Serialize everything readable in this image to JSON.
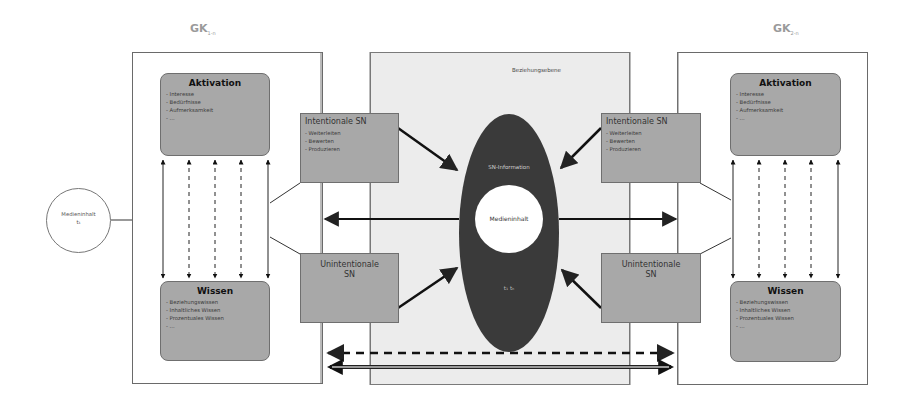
{
  "diagram": {
    "left_group": {
      "label": "GK",
      "label_sub": "1-n",
      "activation": {
        "title": "Aktivation",
        "items": [
          "- Interesse",
          "- Bedürfnisse",
          "- Aufmerksamkeit",
          "- ..."
        ]
      },
      "knowledge": {
        "title": "Wissen",
        "items": [
          "- Beziehungswissen",
          "- Inhaltliches Wissen",
          "- Prozentuales Wissen",
          "- ..."
        ]
      },
      "intentional_sn": {
        "title": "Intentionale SN",
        "items": [
          "- Weiterleiten",
          "- Bewerten",
          "- Produzieren"
        ]
      },
      "unintentional_sn": {
        "title_line1": "Unintentionale",
        "title_line2": "SN"
      }
    },
    "right_group": {
      "label": "GK",
      "label_sub": "2-n",
      "activation": {
        "title": "Aktivation",
        "items": [
          "- Interesse",
          "- Bedürfnisse",
          "- Aufmerksamkeit",
          "- ..."
        ]
      },
      "knowledge": {
        "title": "Wissen",
        "items": [
          "- Beziehungswissen",
          "- Inhaltliches Wissen",
          "- Prozentuales Wissen",
          "- ..."
        ]
      },
      "intentional_sn": {
        "title": "Intentionale SN",
        "items": [
          "- Weiterleiten",
          "- Bewerten",
          "- Produzieren"
        ]
      },
      "unintentional_sn": {
        "title_line1": "Unintentionale",
        "title_line2": "SN"
      }
    },
    "center": {
      "level_label": "Beziehungsebene",
      "ellipse_top_label": "SN-Information",
      "inner_circle_label": "Medieninhalt",
      "ellipse_bottom_label": "t₁ tₙ"
    },
    "source": {
      "label": "Medieninhalt",
      "sub": "t₁"
    },
    "colors": {
      "box_fill": "#a8a8a8",
      "center_panel": "#ececec",
      "ellipse": "#3a3a3a",
      "label_gray": "#9a9a9a"
    }
  }
}
